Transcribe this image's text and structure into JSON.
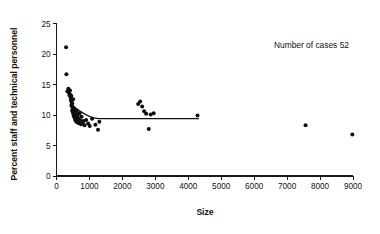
{
  "chart_data": {
    "type": "scatter",
    "title": "",
    "xlabel": "Size",
    "ylabel": "Percent staff and technical personnel",
    "xlim": [
      0,
      9000
    ],
    "ylim": [
      0,
      25
    ],
    "xticks": [
      0,
      1000,
      2000,
      3000,
      4000,
      5000,
      6000,
      7000,
      8000,
      9000
    ],
    "xtick_labels": [
      "0",
      "1000",
      "2000",
      "3000",
      "4000",
      "5000",
      "6000",
      "7000",
      "8000",
      "9000"
    ],
    "yticks": [
      0,
      5,
      10,
      15,
      20,
      25
    ],
    "ytick_labels": [
      "0",
      "5",
      "10",
      "15",
      "20",
      "25"
    ],
    "grid": false,
    "legend": null,
    "annotations": [
      {
        "text": "Number of cases 52",
        "x": 5200,
        "y": 21.5
      }
    ],
    "marker_color": "#0d0d0d",
    "marker_size": 2.0,
    "series": [
      {
        "name": "Establishments",
        "type": "scatter",
        "x": [
          290,
          300,
          330,
          360,
          380,
          395,
          410,
          420,
          430,
          440,
          450,
          455,
          460,
          470,
          475,
          480,
          490,
          500,
          505,
          515,
          520,
          530,
          540,
          550,
          560,
          570,
          580,
          590,
          600,
          610,
          620,
          640,
          650,
          660,
          680,
          700,
          720,
          740,
          760,
          790,
          820,
          850,
          900,
          960,
          1010,
          1080,
          1180,
          1260,
          1300,
          2480,
          2540,
          2600,
          2660,
          2720,
          2800,
          2860,
          2950,
          4280,
          7560,
          8980
        ],
        "y": [
          21.1,
          16.7,
          13.9,
          14.3,
          13.6,
          13.2,
          14.0,
          13.3,
          12.8,
          12.4,
          13.1,
          11.6,
          12.1,
          11.4,
          10.7,
          11.9,
          11.0,
          10.4,
          12.6,
          10.1,
          11.2,
          9.8,
          10.5,
          9.5,
          10.9,
          9.2,
          10.2,
          9.9,
          8.9,
          10.6,
          9.6,
          9.3,
          10.0,
          8.7,
          9.4,
          10.3,
          9.1,
          8.5,
          9.7,
          8.8,
          9.0,
          8.3,
          9.2,
          8.6,
          8.2,
          9.4,
          8.4,
          7.6,
          8.9,
          11.8,
          12.2,
          11.4,
          10.6,
          10.2,
          7.7,
          10.1,
          10.3,
          9.9,
          8.3,
          6.8
        ]
      }
    ],
    "fit_line": {
      "name": "fitted-level",
      "type": "line",
      "x_start": 470,
      "x_end": 4320,
      "y_start": 11.6,
      "y_end": 9.4,
      "knee_x": 1300,
      "knee_y": 9.4
    }
  }
}
